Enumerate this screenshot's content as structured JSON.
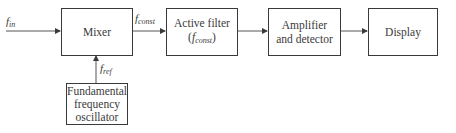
{
  "diagram": {
    "type": "block-diagram",
    "blocks": [
      {
        "id": "mixer",
        "label": "Mixer"
      },
      {
        "id": "active_filter",
        "label_line1": "Active filter",
        "label_line2_base": "f",
        "label_line2_sub": "const"
      },
      {
        "id": "amplifier",
        "label_line1": "Amplifier",
        "label_line2": "and detector"
      },
      {
        "id": "display",
        "label": "Display"
      },
      {
        "id": "oscillator",
        "label_line1": "Fundamental",
        "label_line2": "frequency",
        "label_line3": "oscillator"
      }
    ],
    "signals": {
      "input": {
        "base": "f",
        "sub": "in"
      },
      "mixer_out": {
        "base": "f",
        "sub": "const"
      },
      "reference": {
        "base": "f",
        "sub": "ref"
      }
    },
    "connections": [
      {
        "from": "input",
        "to": "mixer",
        "label": "f_in"
      },
      {
        "from": "oscillator",
        "to": "mixer",
        "label": "f_ref"
      },
      {
        "from": "mixer",
        "to": "active_filter",
        "label": "f_const"
      },
      {
        "from": "active_filter",
        "to": "amplifier"
      },
      {
        "from": "amplifier",
        "to": "display"
      }
    ],
    "colors": {
      "stroke": "#3a3a3a",
      "background": "#ffffff"
    }
  }
}
